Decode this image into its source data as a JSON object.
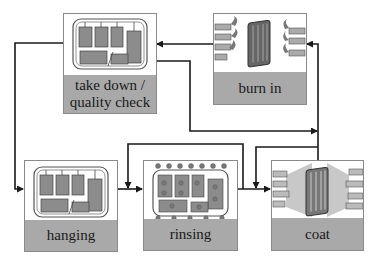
{
  "diagram": {
    "type": "process-cycle",
    "colors": {
      "label_bg": "#a9a9a9",
      "line": "#1a1a1a",
      "rack_fill": "#8c8c8c",
      "box_border": "#8a8a8a"
    },
    "steps": [
      {
        "id": "take_down",
        "label": "take down / quality check",
        "label_lines": [
          "take down /",
          "quality check"
        ],
        "icon": "rack-icon"
      },
      {
        "id": "burn_in",
        "label": "burn in",
        "icon": "oven-flame-icon"
      },
      {
        "id": "hanging",
        "label": "hanging",
        "icon": "rack-icon"
      },
      {
        "id": "rinsing",
        "label": "rinsing",
        "icon": "rinse-spray-icon"
      },
      {
        "id": "coat",
        "label": "coat",
        "icon": "spray-coat-icon"
      }
    ],
    "flows": [
      {
        "from": "take_down",
        "to": "hanging"
      },
      {
        "from": "hanging",
        "to": "rinsing"
      },
      {
        "from": "rinsing",
        "to": "coat"
      },
      {
        "from": "coat",
        "to": "burn_in"
      },
      {
        "from": "burn_in",
        "to": "take_down"
      },
      {
        "from": "take_down",
        "to": "coat"
      },
      {
        "from": "rinsing",
        "to": "rinsing"
      },
      {
        "from": "coat",
        "to": "coat"
      }
    ]
  }
}
